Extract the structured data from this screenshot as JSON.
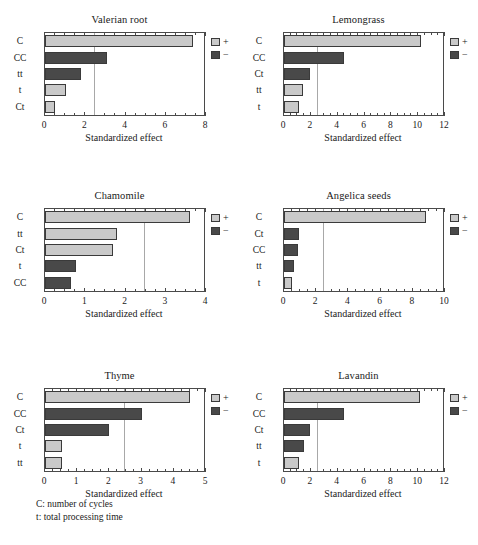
{
  "figure": {
    "xlabel": "Standardized effect",
    "legend": {
      "positive": "+",
      "negative": "−"
    },
    "footnotes": [
      "C: number of cycles",
      "t: total processing time"
    ],
    "colors": {
      "positive_bar": "#c9c9c9",
      "negative_bar": "#494949",
      "bar_outline": "#3a3a3a",
      "axis": "#4a4a4a",
      "reference_line": "#a8a8a8",
      "background": "#ffffff",
      "text": "#1a1a1a"
    }
  },
  "chart_data": [
    {
      "type": "bar",
      "title": "Valerian root",
      "xlabel": "Standardized effect",
      "ylabel": "",
      "orientation": "horizontal",
      "xlim": [
        0,
        8
      ],
      "xticks": [
        0,
        2,
        4,
        6,
        8
      ],
      "minor_tick_step": 0.5,
      "reference_line": 2.45,
      "grid": false,
      "legend_position": "right",
      "categories": [
        "C",
        "CC",
        "tt",
        "t",
        "Ct"
      ],
      "values": [
        7.35,
        3.1,
        1.8,
        1.05,
        0.5
      ],
      "signs": [
        "+",
        "−",
        "−",
        "+",
        "+"
      ]
    },
    {
      "type": "bar",
      "title": "Lemongrass",
      "xlabel": "Standardized effect",
      "ylabel": "",
      "orientation": "horizontal",
      "xlim": [
        0,
        12
      ],
      "xticks": [
        0,
        2,
        4,
        6,
        8,
        10,
        12
      ],
      "minor_tick_step": 0.5,
      "reference_line": 2.45,
      "grid": false,
      "legend_position": "right",
      "categories": [
        "C",
        "CC",
        "Ct",
        "tt",
        "t"
      ],
      "values": [
        10.2,
        4.45,
        1.95,
        1.4,
        1.15
      ],
      "signs": [
        "+",
        "−",
        "−",
        "+",
        "+"
      ]
    },
    {
      "type": "bar",
      "title": "Chamomile",
      "xlabel": "Standardized effect",
      "ylabel": "",
      "orientation": "horizontal",
      "xlim": [
        0,
        4
      ],
      "xticks": [
        0,
        1,
        2,
        3,
        4
      ],
      "minor_tick_step": 0.25,
      "reference_line": 2.45,
      "grid": false,
      "legend_position": "right",
      "categories": [
        "C",
        "tt",
        "Ct",
        "t",
        "CC"
      ],
      "values": [
        3.6,
        1.8,
        1.7,
        0.78,
        0.65
      ],
      "signs": [
        "+",
        "+",
        "+",
        "−",
        "−"
      ]
    },
    {
      "type": "bar",
      "title": "Angelica seeds",
      "xlabel": "Standardized effect",
      "ylabel": "",
      "orientation": "horizontal",
      "xlim": [
        0,
        10
      ],
      "xticks": [
        0,
        2,
        4,
        6,
        8,
        10
      ],
      "minor_tick_step": 0.5,
      "reference_line": 2.45,
      "grid": false,
      "legend_position": "right",
      "categories": [
        "C",
        "Ct",
        "CC",
        "tt",
        "t"
      ],
      "values": [
        8.85,
        0.95,
        0.9,
        0.62,
        0.5
      ],
      "signs": [
        "+",
        "−",
        "−",
        "−",
        "+"
      ]
    },
    {
      "type": "bar",
      "title": "Thyme",
      "xlabel": "Standardized effect",
      "ylabel": "",
      "orientation": "horizontal",
      "xlim": [
        0,
        5
      ],
      "xticks": [
        0,
        1,
        2,
        3,
        4,
        5
      ],
      "minor_tick_step": 0.25,
      "reference_line": 2.45,
      "grid": false,
      "legend_position": "right",
      "categories": [
        "C",
        "CC",
        "Ct",
        "t",
        "tt"
      ],
      "values": [
        4.5,
        3.0,
        2.0,
        0.52,
        0.52
      ],
      "signs": [
        "+",
        "−",
        "−",
        "+",
        "+"
      ]
    },
    {
      "type": "bar",
      "title": "Lavandin",
      "xlabel": "Standardized effect",
      "ylabel": "",
      "orientation": "horizontal",
      "xlim": [
        0,
        12
      ],
      "xticks": [
        0,
        2,
        4,
        6,
        8,
        10,
        12
      ],
      "minor_tick_step": 0.5,
      "reference_line": 2.45,
      "grid": false,
      "legend_position": "right",
      "categories": [
        "C",
        "CC",
        "Ct",
        "tt",
        "t"
      ],
      "values": [
        10.1,
        4.45,
        1.95,
        1.5,
        1.15
      ],
      "signs": [
        "+",
        "−",
        "−",
        "−",
        "+"
      ]
    }
  ]
}
